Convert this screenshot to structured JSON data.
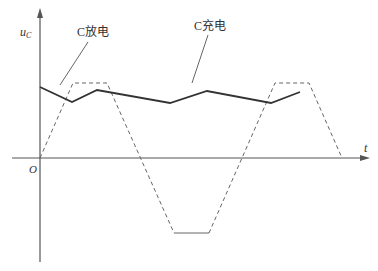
{
  "diagram": {
    "type": "waveform",
    "axes": {
      "y_label": "u",
      "y_label_sub": "C",
      "x_label": "t",
      "origin_label": "O"
    },
    "annotations": [
      {
        "text": "C放电",
        "meaning": "capacitor discharging"
      },
      {
        "text": "C充电",
        "meaning": "capacitor charging"
      }
    ],
    "series": [
      {
        "name": "capacitor-voltage",
        "style": "solid",
        "points": [
          [
            40,
            87
          ],
          [
            72,
            102
          ],
          [
            97,
            90
          ],
          [
            170,
            103
          ],
          [
            207,
            91
          ],
          [
            271,
            103
          ],
          [
            300,
            92
          ]
        ]
      },
      {
        "name": "trapezoidal-wave",
        "style": "dashed",
        "points": [
          [
            40,
            158
          ],
          [
            73,
            83
          ],
          [
            107,
            83
          ],
          [
            174,
            233
          ],
          [
            209,
            233
          ],
          [
            275,
            83
          ],
          [
            309,
            83
          ],
          [
            342,
            158
          ]
        ]
      }
    ],
    "colors": {
      "axis": "#555555",
      "solid": "#333333",
      "dashed": "#666666"
    }
  }
}
